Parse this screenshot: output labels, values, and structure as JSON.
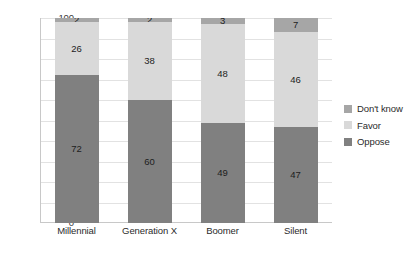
{
  "chart_data": {
    "type": "bar",
    "subtype": "stacked-column-100",
    "title": "",
    "subtitle": "",
    "xlabel": "",
    "ylabel": "",
    "ylim": [
      0,
      100
    ],
    "ytick_step": 10,
    "yticks": [
      100,
      90,
      80,
      70,
      60,
      50,
      40,
      30,
      20,
      10,
      0
    ],
    "grid": "horizontal",
    "legend_position": "right",
    "categories": [
      "Millennial",
      "Generation X",
      "Boomer",
      "Silent"
    ],
    "stack_order_bottom_to_top": [
      "Oppose",
      "Favor",
      "Don't know"
    ],
    "series": [
      {
        "name": "Oppose",
        "color": "#808080",
        "values": [
          72,
          60,
          49,
          47
        ]
      },
      {
        "name": "Favor",
        "color": "#d9d9d9",
        "values": [
          26,
          38,
          48,
          46
        ]
      },
      {
        "name": "Don't know",
        "color": "#a6a6a6",
        "values": [
          2,
          2,
          3,
          7
        ]
      }
    ],
    "legend_entries": [
      {
        "label": "Don't know",
        "color": "#a6a6a6"
      },
      {
        "label": "Favor",
        "color": "#d9d9d9"
      },
      {
        "label": "Oppose",
        "color": "#808080"
      }
    ],
    "data_labels": {
      "Millennial": {
        "Don't know": "2",
        "Favor": "26",
        "Oppose": "72"
      },
      "Generation X": {
        "Don't know": "2",
        "Favor": "38",
        "Oppose": "60"
      },
      "Boomer": {
        "Don't know": "3",
        "Favor": "48",
        "Oppose": "49"
      },
      "Silent": {
        "Don't know": "7",
        "Favor": "46",
        "Oppose": "47"
      }
    }
  },
  "colors": {
    "background": "#ffffff",
    "gridline": "#e2e2e2",
    "axis": "#c8c8c8",
    "tick_text": "#3a3a3a",
    "label_text": "#2b2b2b"
  }
}
